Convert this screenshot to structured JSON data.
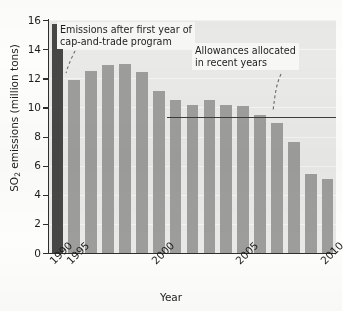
{
  "chart_data": {
    "type": "bar",
    "title": "",
    "xlabel": "Year",
    "ylabel": "SO2 emissions (million tons)",
    "ylabel_display": "SO",
    "ylabel_sub": "2",
    "ylabel_rest": " emissions (million tons)",
    "ylim": [
      0,
      16
    ],
    "ytick_step": 2,
    "yticks": [
      0,
      2,
      4,
      6,
      8,
      10,
      12,
      14,
      16
    ],
    "ytick_labels": [
      "0",
      "2",
      "4",
      "6",
      "8",
      "10",
      "12",
      "14",
      "16"
    ],
    "grid": true,
    "legend": "none",
    "categories": [
      1990,
      1995,
      1996,
      1997,
      1998,
      1999,
      2000,
      2001,
      2002,
      2003,
      2004,
      2005,
      2006,
      2007,
      2008,
      2009,
      2010
    ],
    "xtick_labels": [
      "1990",
      "1995",
      "2000",
      "2005",
      "2010"
    ],
    "xtick_categories": [
      1990,
      1995,
      2000,
      2005,
      2010
    ],
    "values": [
      15.7,
      11.9,
      12.5,
      12.9,
      13.0,
      12.4,
      11.1,
      10.5,
      10.2,
      10.5,
      10.2,
      10.1,
      9.5,
      8.9,
      7.6,
      5.4,
      5.1
    ],
    "bar_colors": [
      "#474746",
      "#9d9d9b",
      "#9d9d9b",
      "#9d9d9b",
      "#9d9d9b",
      "#9d9d9b",
      "#9d9d9b",
      "#9d9d9b",
      "#9d9d9b",
      "#9d9d9b",
      "#9d9d9b",
      "#9d9d9b",
      "#9d9d9b",
      "#9d9d9b",
      "#9d9d9b",
      "#9d9d9b",
      "#9d9d9b"
    ],
    "reference_line": {
      "label": "Allowances allocated",
      "value": 9.35,
      "x_start_category": 2001,
      "color": "#3c3c3b"
    },
    "annotations": [
      {
        "id": "annotation-emissions",
        "text": "Emissions after first year of\ncap-and-trade program",
        "points_to_category": 1995
      },
      {
        "id": "annotation-allowances",
        "text": "Allowances allocated\nin recent years",
        "points_to_value": 9.35
      }
    ]
  },
  "axis": {
    "x_title": "Year"
  },
  "colors": {
    "bar_light": "#9d9d9b",
    "bar_dark": "#474746",
    "plot_background": "#e9e9e7",
    "axis": "#2e2e2d",
    "gridline": "#f4f4f2",
    "annotation_background": "#f7f7f5",
    "text": "#1d1d1c"
  }
}
